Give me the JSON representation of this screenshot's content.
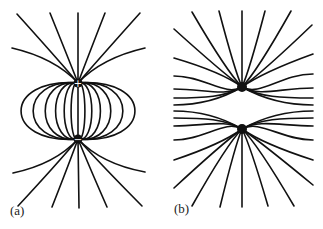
{
  "figure": {
    "panels": [
      {
        "id": "a",
        "label": "(a)",
        "description": "Electric field lines of an electric dipole (opposite charges)",
        "charges": [
          {
            "sign": "+",
            "x": 78,
            "y": 83
          },
          {
            "sign": "−",
            "x": 78,
            "y": 139
          }
        ]
      },
      {
        "id": "b",
        "label": "(b)",
        "description": "Electric field lines of two like charges",
        "charges": [
          {
            "sign": "",
            "x": 242,
            "y": 87
          },
          {
            "sign": "",
            "x": 242,
            "y": 129
          }
        ]
      }
    ]
  }
}
